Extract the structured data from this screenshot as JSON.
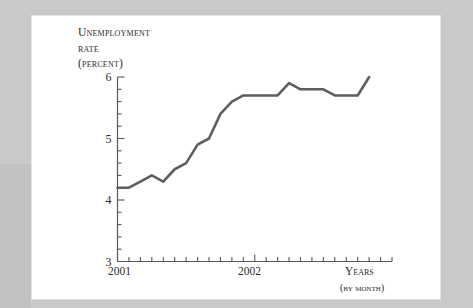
{
  "figure": {
    "axis_title_lines": [
      "Unemployment",
      "rate",
      "(percent)"
    ],
    "x_axis_label": "Years",
    "x_axis_sublabel": "(by month)",
    "x_tick_labels": [
      "2001",
      "2002"
    ],
    "y_tick_labels": [
      "3",
      "4",
      "5",
      "6"
    ]
  },
  "colors": {
    "line": "#5e5e5e",
    "axis": "#5a5a5a",
    "text": "#2c2c2c",
    "paper": "#ffffff",
    "frame": "#c9c9c9",
    "band": "#c2c2c2"
  },
  "chart_data": {
    "type": "line",
    "title": "Unemployment rate (percent)",
    "xlabel": "Years (by month)",
    "ylabel": "Unemployment rate (percent)",
    "xlim": [
      0,
      25
    ],
    "ylim": [
      3,
      6
    ],
    "grid": false,
    "legend": null,
    "y_ticks": [
      3,
      4,
      5,
      6
    ],
    "y_minor_tick_step": 0.2,
    "x_tick_step_months": 1,
    "x_categories": [
      "2001-01",
      "2001-02",
      "2001-03",
      "2001-04",
      "2001-05",
      "2001-06",
      "2001-07",
      "2001-08",
      "2001-09",
      "2001-10",
      "2001-11",
      "2001-12",
      "2002-01",
      "2002-02",
      "2002-03",
      "2002-04",
      "2002-05",
      "2002-06",
      "2002-07",
      "2002-08",
      "2002-09",
      "2002-10",
      "2002-11"
    ],
    "series": [
      {
        "name": "Unemployment rate",
        "values": [
          4.2,
          4.2,
          4.3,
          4.4,
          4.3,
          4.5,
          4.6,
          4.9,
          5.0,
          5.4,
          5.6,
          5.7,
          5.7,
          5.7,
          5.7,
          5.9,
          5.8,
          5.8,
          5.8,
          5.7,
          5.7,
          5.7,
          6.0
        ]
      }
    ]
  }
}
